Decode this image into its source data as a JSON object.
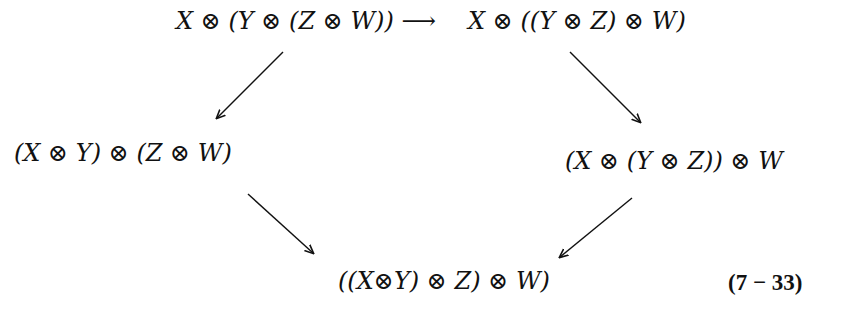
{
  "diagram": {
    "nodes": {
      "top_left": "X ⊗ (Y ⊗ (Z ⊗ W)) ⟶",
      "top_right": "X ⊗ ((Y ⊗ Z) ⊗ W)",
      "mid_left": "(X ⊗ Y) ⊗ (Z ⊗ W)",
      "mid_right": "(X ⊗ (Y ⊗ Z)) ⊗ W",
      "bottom": "((X⊗Y) ⊗ Z) ⊗ W)"
    },
    "equation_label": "(7 − 33)",
    "arrows": [
      {
        "from": "top_left",
        "to": "top_right"
      },
      {
        "from": "top_left",
        "to": "mid_left"
      },
      {
        "from": "top_right",
        "to": "mid_right"
      },
      {
        "from": "mid_left",
        "to": "bottom"
      },
      {
        "from": "mid_right",
        "to": "bottom"
      }
    ]
  }
}
